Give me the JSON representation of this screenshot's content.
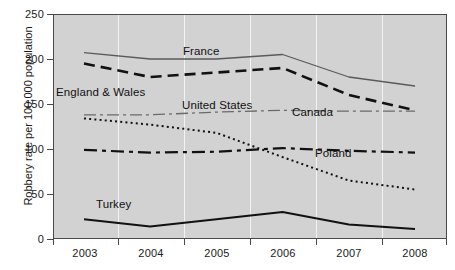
{
  "chart_data": {
    "type": "line",
    "title": "",
    "xlabel": "",
    "ylabel": "Robbery rate per 100,000 population",
    "x": [
      "2003",
      "2004",
      "2005",
      "2006",
      "2007",
      "2008"
    ],
    "categories": [
      "2003",
      "2004",
      "2005",
      "2006",
      "2007",
      "2008"
    ],
    "ylim": [
      0,
      250
    ],
    "yticks": [
      0,
      50,
      100,
      150,
      200,
      250
    ],
    "ytick_labels": [
      "0",
      "50",
      "100",
      "150",
      "200",
      "250"
    ],
    "grid": "vertical",
    "legend": "inline-labels",
    "plot_background": "#d2d2d2",
    "series": [
      {
        "name": "France",
        "style": "solid-thin",
        "color": "#5a5a5a",
        "values": [
          207,
          200,
          200,
          205,
          180,
          170
        ],
        "label_x": 183,
        "label_y": 45
      },
      {
        "name": "England & Wales",
        "style": "dashed-bold",
        "color": "#111111",
        "values": [
          195,
          180,
          185,
          190,
          160,
          143
        ],
        "label_x": 56,
        "label_y": 86
      },
      {
        "name": "United States",
        "style": "dash-dot-thin",
        "color": "#6a6a6a",
        "values": [
          138,
          138,
          141,
          143,
          142,
          142
        ],
        "label_x": 182,
        "label_y": 99
      },
      {
        "name": "Canada",
        "style": "dash-dot-bold",
        "color": "#111111",
        "values": [
          99,
          96,
          97,
          101,
          98,
          96
        ],
        "label_x": 292,
        "label_y": 106
      },
      {
        "name": "Poland",
        "style": "dotted",
        "color": "#111111",
        "values": [
          134,
          127,
          118,
          91,
          65,
          55
        ],
        "label_x": 315,
        "label_y": 147
      },
      {
        "name": "Turkey",
        "style": "solid-bold",
        "color": "#111111",
        "values": [
          22,
          14,
          22,
          30,
          16,
          11
        ],
        "label_x": 96,
        "label_y": 198
      }
    ]
  },
  "axes": {
    "y_title": "Robbery rate per 100,000 population",
    "y_labels": [
      "250",
      "200",
      "150",
      "100",
      "50",
      "0"
    ],
    "x_labels": [
      "2003",
      "2004",
      "2005",
      "2006",
      "2007",
      "2008"
    ]
  }
}
